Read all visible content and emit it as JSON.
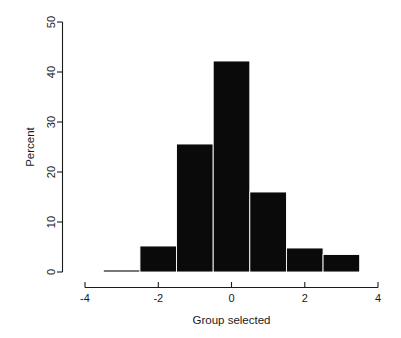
{
  "chart_data": {
    "type": "bar",
    "title": "",
    "subtitle": "",
    "xlabel": "Group selected",
    "ylabel": "Percent",
    "xlim": [
      -4,
      4
    ],
    "ylim": [
      0,
      50
    ],
    "grid": false,
    "legend": null,
    "bin_width": 1,
    "x": [
      -3.0,
      -2.0,
      -1.0,
      0.0,
      1.0,
      2.0,
      3.0
    ],
    "bin_edges": [
      -3.5,
      -2.5,
      -1.5,
      -0.5,
      0.5,
      1.5,
      2.5,
      3.5
    ],
    "categories": [
      "-3.5 to -2.5",
      "-2.5 to -1.5",
      "-1.5 to -0.5",
      "-0.5 to 0.5",
      "0.5 to 1.5",
      "1.5 to 2.5",
      "2.5 to 3.5"
    ],
    "values": [
      0.4,
      5.2,
      25.6,
      42.2,
      16.0,
      4.8,
      3.5
    ],
    "xticks": [
      -4,
      -2,
      0,
      2,
      4
    ],
    "xtick_labels": [
      "-4",
      "-2",
      "0",
      "2",
      "4"
    ],
    "yticks": [
      0,
      10,
      20,
      30,
      40,
      50
    ],
    "ytick_labels": [
      "0",
      "10",
      "20",
      "30",
      "40",
      "50"
    ],
    "bar_color": "#0a0a0a",
    "axis_color": "#1a1a1a",
    "background_color": "#ffffff"
  },
  "axes": {
    "x_title": "Group selected",
    "y_title": "Percent"
  },
  "xtick": {
    "t0": "-4",
    "t1": "-2",
    "t2": "0",
    "t3": "2",
    "t4": "4"
  },
  "ytick": {
    "t0": "0",
    "t1": "10",
    "t2": "20",
    "t3": "30",
    "t4": "40",
    "t5": "50"
  }
}
